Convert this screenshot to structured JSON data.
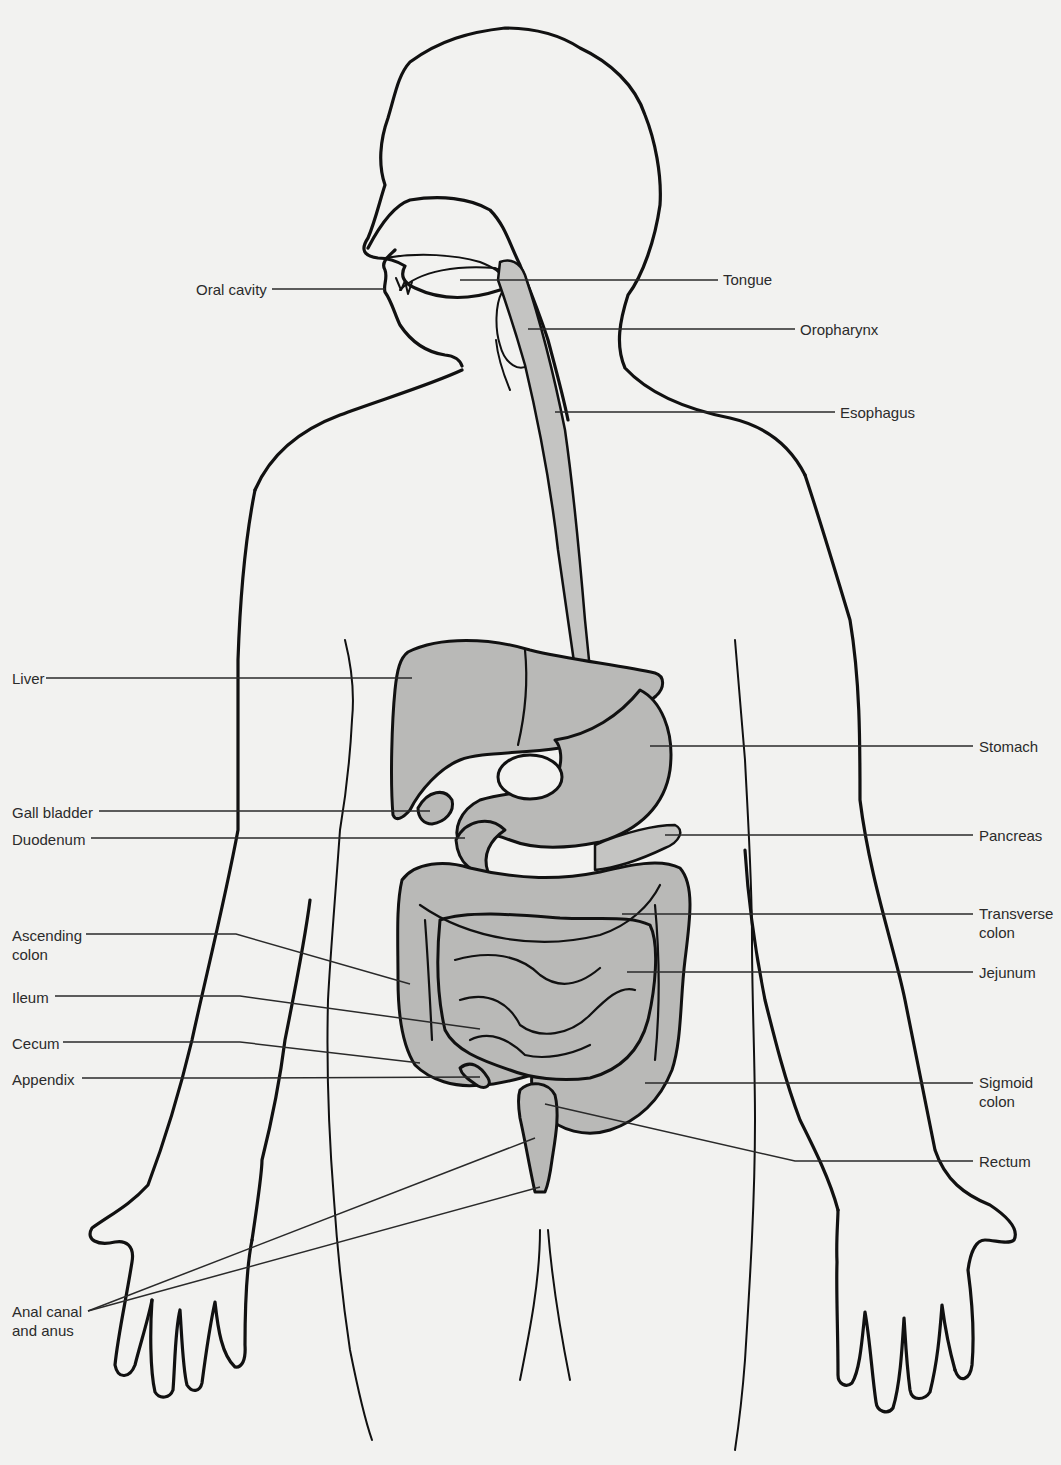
{
  "diagram": {
    "colors": {
      "background": "#f2f2f0",
      "organ_fill": "#b9b9b7",
      "outline": "#111111",
      "label_text": "#2b2b2b"
    },
    "labels": [
      {
        "id": "oral-cavity",
        "text": "Oral cavity",
        "side": "left",
        "x": 196,
        "y": 295,
        "line": [
          272,
          289,
          385,
          289
        ]
      },
      {
        "id": "tongue",
        "text": "Tongue",
        "side": "right",
        "x": 723,
        "y": 285,
        "line": [
          460,
          280,
          718,
          280
        ]
      },
      {
        "id": "oropharynx",
        "text": "Oropharynx",
        "side": "right",
        "x": 800,
        "y": 335,
        "line": [
          528,
          329,
          795,
          329
        ]
      },
      {
        "id": "esophagus",
        "text": "Esophagus",
        "side": "right",
        "x": 840,
        "y": 418,
        "line": [
          555,
          412,
          835,
          412
        ]
      },
      {
        "id": "liver",
        "text": "Liver",
        "side": "left",
        "x": 12,
        "y": 684,
        "line": [
          46,
          678,
          412,
          678
        ]
      },
      {
        "id": "stomach",
        "text": "Stomach",
        "side": "right",
        "x": 979,
        "y": 752,
        "line": [
          650,
          746,
          973,
          746
        ]
      },
      {
        "id": "gall-bladder",
        "text": "Gall bladder",
        "side": "left",
        "x": 12,
        "y": 818,
        "line": [
          99,
          811,
          430,
          811
        ]
      },
      {
        "id": "duodenum",
        "text": "Duodenum",
        "side": "left",
        "x": 12,
        "y": 845,
        "line": [
          91,
          838,
          465,
          838
        ]
      },
      {
        "id": "pancreas",
        "text": "Pancreas",
        "side": "right",
        "x": 979,
        "y": 841,
        "line": [
          665,
          835,
          973,
          835
        ]
      },
      {
        "id": "transverse-colon",
        "text": "Transverse",
        "text2": "colon",
        "side": "right",
        "x": 979,
        "y": 919,
        "line": [
          622,
          914,
          973,
          914
        ]
      },
      {
        "id": "ascending-colon",
        "text": "Ascending",
        "text2": "colon",
        "side": "left",
        "x": 12,
        "y": 941,
        "line": [
          86,
          934,
          236,
          934,
          410,
          984
        ]
      },
      {
        "id": "jejunum",
        "text": "Jejunum",
        "side": "right",
        "x": 979,
        "y": 978,
        "line": [
          627,
          972,
          973,
          972
        ]
      },
      {
        "id": "ileum",
        "text": "Ileum",
        "side": "left",
        "x": 12,
        "y": 1003,
        "line": [
          55,
          996,
          240,
          996,
          480,
          1029
        ]
      },
      {
        "id": "cecum",
        "text": "Cecum",
        "side": "left",
        "x": 12,
        "y": 1049,
        "line": [
          63,
          1042,
          240,
          1042,
          420,
          1063
        ]
      },
      {
        "id": "appendix",
        "text": "Appendix",
        "side": "left",
        "x": 12,
        "y": 1085,
        "line": [
          82,
          1078,
          240,
          1078,
          480,
          1077
        ]
      },
      {
        "id": "sigmoid-colon",
        "text": "Sigmoid",
        "text2": "colon",
        "side": "right",
        "x": 979,
        "y": 1088,
        "line": [
          645,
          1083,
          973,
          1083
        ]
      },
      {
        "id": "rectum",
        "text": "Rectum",
        "side": "right",
        "x": 979,
        "y": 1167,
        "line": [
          545,
          1104,
          795,
          1161,
          973,
          1161
        ]
      },
      {
        "id": "anal-canal",
        "text": "Anal canal",
        "text2": "and anus",
        "side": "left",
        "x": 12,
        "y": 1317,
        "line": [
          88,
          1311,
          535,
          1138
        ],
        "line2": [
          88,
          1311,
          540,
          1187
        ]
      }
    ]
  }
}
